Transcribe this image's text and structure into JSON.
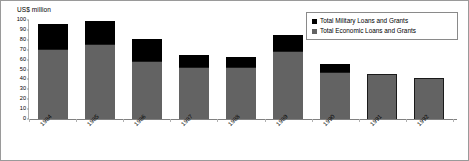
{
  "chart_data": {
    "type": "bar",
    "subtype": "stacked-vertical",
    "title": "",
    "xlabel": "",
    "ylabel": "US$ million",
    "ylim": [
      0,
      100
    ],
    "yticks": [
      0,
      10,
      20,
      30,
      40,
      50,
      60,
      70,
      80,
      90,
      100
    ],
    "ytick_labels": [
      "0",
      "10",
      "20",
      "30",
      "40",
      "50",
      "60",
      "70",
      "80",
      "90",
      "100"
    ],
    "grid": false,
    "legend_position": "top-right",
    "categories": [
      "1984",
      "1985",
      "1986",
      "1987",
      "1988",
      "1989",
      "1990",
      "1991",
      "1992"
    ],
    "series": [
      {
        "name": "Total Military Loans and Grants",
        "color": "#000000",
        "values": [
          25,
          23,
          22,
          12,
          10,
          16,
          9,
          0,
          0
        ]
      },
      {
        "name": "Total Economic Loans and Grants",
        "color": "#636363",
        "values": [
          71,
          76,
          59,
          53,
          53,
          69,
          47,
          45,
          41
        ]
      }
    ],
    "totals": [
      96,
      99,
      81,
      65,
      63,
      85,
      56,
      45,
      41
    ]
  },
  "legend": {
    "items": [
      {
        "label": "Total Military Loans and Grants",
        "color": "#000000"
      },
      {
        "label": "Total Economic Loans and Grants",
        "color": "#636363"
      }
    ]
  },
  "axis": {
    "y_title": "US$ million"
  }
}
